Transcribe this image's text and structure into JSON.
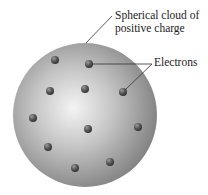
{
  "diagram": {
    "labels": {
      "cloud_line1": "Spherical cloud of",
      "cloud_line2": "positive charge",
      "electrons": "Electrons"
    },
    "sphere": {
      "cx": 85,
      "cy": 115,
      "r": 72,
      "highlight_color": "#f2f2f2",
      "mid_color": "#b3b3b3",
      "edge_color": "#7a7a7a"
    },
    "electron_color": "#555555",
    "electrons": [
      {
        "x": 55,
        "y": 60
      },
      {
        "x": 89,
        "y": 64
      },
      {
        "x": 50,
        "y": 91
      },
      {
        "x": 85,
        "y": 89
      },
      {
        "x": 123,
        "y": 92
      },
      {
        "x": 33,
        "y": 118
      },
      {
        "x": 88,
        "y": 129
      },
      {
        "x": 138,
        "y": 127
      },
      {
        "x": 48,
        "y": 147
      },
      {
        "x": 110,
        "y": 162
      },
      {
        "x": 75,
        "y": 168
      }
    ]
  }
}
